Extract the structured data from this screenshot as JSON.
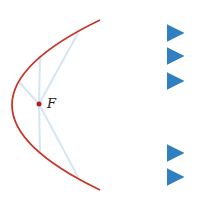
{
  "diagram": {
    "focus_label": "F",
    "colors": {
      "parabola": "#c8352b",
      "ray": "#2f7fc1",
      "ray_faint": "#cfe0f0",
      "focus": "#b01e1e"
    },
    "rays_count": 5
  }
}
